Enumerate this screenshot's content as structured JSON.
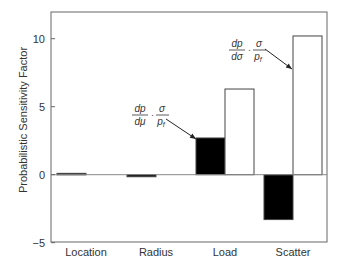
{
  "chart_data": {
    "type": "bar",
    "title": "",
    "xlabel": "",
    "ylabel": "Probabilistic Sensitivity Factor",
    "categories": [
      "Location",
      "Radius",
      "Load",
      "Scatter"
    ],
    "series": [
      {
        "name": "dp/dμ · σ/p_f (mean sensitivity)",
        "fill": "#000000",
        "values": [
          0.1,
          -0.15,
          2.7,
          -3.3
        ]
      },
      {
        "name": "dp/dσ · σ/p_f (std. dev. sensitivity)",
        "fill": "#ffffff",
        "values": [
          0.0,
          0.0,
          6.3,
          10.2
        ]
      }
    ],
    "ylim": [
      -5,
      12
    ],
    "yticks": [
      -5,
      0,
      5,
      10
    ],
    "ytick_labels": [
      "−5",
      "0",
      "5",
      "10"
    ],
    "grid": false,
    "legend": "none",
    "annotations": [
      {
        "id": "mean",
        "num1": "dp",
        "den1": "dμ",
        "num2": "σ",
        "den2": "p",
        "den2_sub": "f",
        "points_to": "Load (black bar)"
      },
      {
        "id": "sigma",
        "num1": "dp",
        "den1": "dσ",
        "num2": "σ",
        "den2": "p",
        "den2_sub": "f",
        "points_to": "Scatter (white bar)"
      }
    ]
  },
  "colors": {
    "axis": "#555555",
    "text": "#333333",
    "bar_dark": "#000000",
    "bar_light": "#ffffff"
  }
}
